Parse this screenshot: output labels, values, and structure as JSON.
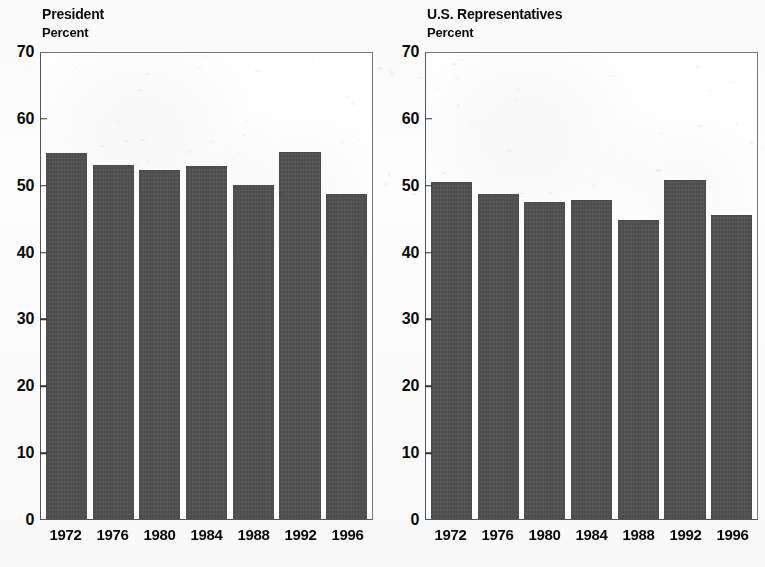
{
  "figure": {
    "background_color": "#ffffff",
    "bar_color": "#4d4d4d",
    "axis_color": "#333333"
  },
  "chart_data": [
    {
      "type": "bar",
      "title": "President",
      "ylabel": "Percent",
      "xlabel": "",
      "categories": [
        "1972",
        "1976",
        "1980",
        "1984",
        "1988",
        "1992",
        "1996"
      ],
      "values": [
        55.0,
        53.2,
        52.5,
        53.1,
        50.2,
        55.1,
        48.8
      ],
      "ylim": [
        0,
        70
      ],
      "yticks": [
        0,
        10,
        20,
        30,
        40,
        50,
        60,
        70
      ],
      "ytick_labels": [
        "0",
        "10",
        "20",
        "30",
        "40",
        "50",
        "60",
        "70"
      ],
      "grid": false,
      "legend": "none"
    },
    {
      "type": "bar",
      "title": "U.S. Representatives",
      "ylabel": "Percent",
      "xlabel": "",
      "categories": [
        "1972",
        "1976",
        "1980",
        "1984",
        "1988",
        "1992",
        "1996"
      ],
      "values": [
        50.6,
        48.8,
        47.6,
        47.9,
        44.9,
        50.9,
        45.6
      ],
      "ylim": [
        0,
        70
      ],
      "yticks": [
        0,
        10,
        20,
        30,
        40,
        50,
        60,
        70
      ],
      "ytick_labels": [
        "0",
        "10",
        "20",
        "30",
        "40",
        "50",
        "60",
        "70"
      ],
      "grid": false,
      "legend": "none"
    }
  ]
}
